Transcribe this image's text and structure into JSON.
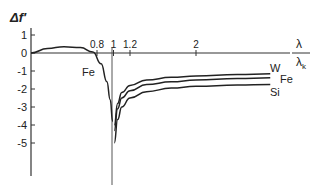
{
  "chart_data": {
    "type": "line",
    "title": "",
    "ylabel": "Δf′",
    "xlabel_num": "λ",
    "xlabel_den": "λk",
    "x_ticks": [
      {
        "value": 0.8,
        "label": "0.8"
      },
      {
        "value": 1,
        "label": "1"
      },
      {
        "value": 1.2,
        "label": "1.2"
      },
      {
        "value": 2,
        "label": "2"
      }
    ],
    "y_ticks": [
      {
        "value": 1,
        "label": "1"
      },
      {
        "value": 0,
        "label": "0"
      },
      {
        "value": -1,
        "label": "-1"
      },
      {
        "value": -2,
        "label": "-2"
      },
      {
        "value": -3,
        "label": "-3"
      },
      {
        "value": -4,
        "label": "-4"
      },
      {
        "value": -5,
        "label": "-5"
      }
    ],
    "xlim": [
      0,
      2.9
    ],
    "ylim": [
      -6.5,
      1.5
    ],
    "grid": false,
    "legend": "inline labels",
    "series": [
      {
        "name": "Fe (below edge)",
        "label": "Fe",
        "x": [
          0,
          0.2,
          0.4,
          0.6,
          0.75,
          0.85,
          0.92,
          0.96,
          0.99
        ],
        "y": [
          0,
          0.25,
          0.35,
          0.3,
          0.05,
          -0.6,
          -1.6,
          -2.6,
          -3.8
        ]
      },
      {
        "name": "W",
        "label": "W",
        "x": [
          1.01,
          1.05,
          1.1,
          1.2,
          1.4,
          1.7,
          2.0,
          2.5,
          2.9
        ],
        "y": [
          -4.0,
          -2.8,
          -2.2,
          -1.8,
          -1.5,
          -1.35,
          -1.28,
          -1.2,
          -1.15
        ]
      },
      {
        "name": "Fe",
        "label": "Fe",
        "x": [
          1.01,
          1.05,
          1.1,
          1.2,
          1.4,
          1.7,
          2.0,
          2.5,
          2.9
        ],
        "y": [
          -4.3,
          -3.1,
          -2.5,
          -2.1,
          -1.75,
          -1.6,
          -1.5,
          -1.42,
          -1.38
        ]
      },
      {
        "name": "Si",
        "label": "Si",
        "x": [
          1.01,
          1.05,
          1.1,
          1.2,
          1.4,
          1.7,
          2.0,
          2.5,
          2.9
        ],
        "y": [
          -5.0,
          -3.7,
          -3.0,
          -2.5,
          -2.15,
          -1.95,
          -1.85,
          -1.78,
          -1.75
        ]
      }
    ]
  }
}
